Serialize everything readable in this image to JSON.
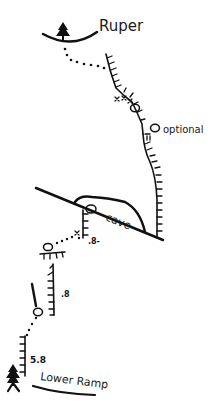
{
  "topo": {
    "top_label": "Ruper",
    "bottom_label": "Lower Ramp",
    "features": {
      "cave": "cave",
      "optional": "optional"
    },
    "grades": {
      "upper_pitch": ".8-",
      "middle_pitch": ".8",
      "first_pitch": "5.8"
    },
    "colors": {
      "ink": "#111111",
      "background": "#ffffff"
    }
  }
}
